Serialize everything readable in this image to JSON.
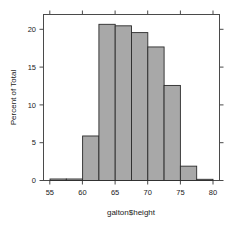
{
  "chart_data": {
    "type": "bar",
    "title": "",
    "subtitle": "",
    "xlabel": "galton$height",
    "ylabel": "Percent of Total",
    "xlim": [
      54.0,
      81.0
    ],
    "ylim": [
      0,
      22.0
    ],
    "xticks": [
      55,
      60,
      65,
      70,
      75,
      80
    ],
    "xtick_labels": [
      "55",
      "60",
      "65",
      "70",
      "75",
      "80"
    ],
    "yticks": [
      0,
      5,
      10,
      15,
      20
    ],
    "ytick_labels": [
      "0",
      "5",
      "10",
      "15",
      "20"
    ],
    "grid": false,
    "legend": null,
    "bin_width": 2.5,
    "bin_edges": [
      55.0,
      57.5,
      60.0,
      62.5,
      65.0,
      67.5,
      70.0,
      72.5,
      75.0,
      77.5,
      80.0
    ],
    "categories": [
      "55-57.5",
      "57.5-60",
      "60-62.5",
      "62.5-65",
      "65-67.5",
      "67.5-70",
      "70-72.5",
      "72.5-75",
      "75-77.5",
      "77.5-80"
    ],
    "values": [
      0.2,
      0.2,
      5.9,
      20.7,
      20.5,
      19.6,
      17.7,
      12.6,
      1.9,
      0.1
    ],
    "bar_fill_color": "#a8a8a8",
    "bar_edge_color": "#2b2b2b",
    "axis_color": "#4a4a4a",
    "background_color": "#ffffff"
  },
  "figure": {
    "name": "histogram-galton-height"
  }
}
